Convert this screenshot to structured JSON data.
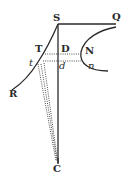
{
  "diagram": {
    "type": "geometric-figure",
    "labels": {
      "S": "S",
      "Q": "Q",
      "T": "T",
      "D": "D",
      "N": "N",
      "t": "t",
      "d": "d",
      "n": "n",
      "R": "R",
      "C": "C"
    },
    "colors": {
      "ink": "#2a2a2a",
      "background": "#ffffff"
    }
  }
}
